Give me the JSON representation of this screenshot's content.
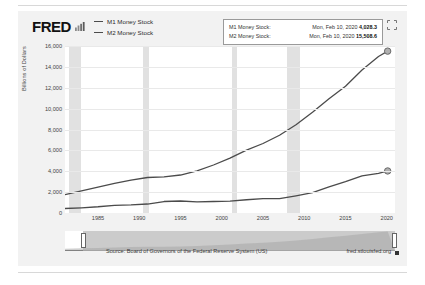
{
  "header": {
    "logo_text": "FRED",
    "logo_mark_icon": "bar-chart-icon",
    "expand_icon": "expand-fullscreen-icon"
  },
  "legend": [
    {
      "label": "M1 Money Stock",
      "color": "#4b4b4b"
    },
    {
      "label": "M2 Money Stock",
      "color": "#4b4b4b"
    }
  ],
  "tooltip": {
    "rows": [
      {
        "name": "M1 Money Stock:",
        "date": "Mon, Feb 10, 2020",
        "value": "4,028.3"
      },
      {
        "name": "M2 Money Stock:",
        "date": "Mon, Feb 10, 2020",
        "value": "15,508.6"
      }
    ]
  },
  "footer": {
    "source": "Source: Board of Governors of the Federal Reserve System (US)",
    "site": "fred.stlouisfed.org"
  },
  "slider": {
    "left_handle_icon": "slider-handle-left",
    "right_handle_icon": "slider-handle-right"
  },
  "chart_data": {
    "type": "line",
    "title": "",
    "xlabel": "",
    "ylabel": "Billions of Dollars",
    "ylim": [
      0,
      16000
    ],
    "yticks": [
      0,
      2000,
      4000,
      6000,
      8000,
      10000,
      12000,
      14000,
      16000
    ],
    "ytick_labels": [
      "0",
      "2,000",
      "4,000",
      "6,000",
      "8,000",
      "10,000",
      "12,000",
      "14,000",
      "16,000"
    ],
    "xlim": [
      1981,
      2021
    ],
    "xticks": [
      1985,
      1990,
      1995,
      2000,
      2005,
      2010,
      2015,
      2020
    ],
    "xtick_labels": [
      "1985",
      "1990",
      "1995",
      "2000",
      "2005",
      "2010",
      "2015",
      "2020"
    ],
    "grid": true,
    "legend_position": "top-left",
    "recession_bands": [
      [
        1981.5,
        1982.9
      ],
      [
        1990.5,
        1991.2
      ],
      [
        2001.2,
        2001.9
      ],
      [
        2007.9,
        2009.5
      ]
    ],
    "series": [
      {
        "name": "M1 Money Stock",
        "color": "#4b4b4b",
        "end_marker": true,
        "x": [
          1981,
          1983,
          1985,
          1987,
          1989,
          1991,
          1993,
          1995,
          1997,
          1999,
          2001,
          2003,
          2005,
          2007,
          2009,
          2011,
          2013,
          2015,
          2017,
          2019,
          2020.11
        ],
        "y": [
          430,
          500,
          600,
          740,
          780,
          860,
          1100,
          1150,
          1070,
          1100,
          1140,
          1270,
          1370,
          1370,
          1650,
          1950,
          2500,
          3000,
          3550,
          3800,
          4028.3
        ]
      },
      {
        "name": "M2 Money Stock",
        "color": "#4b4b4b",
        "end_marker": true,
        "x": [
          1981,
          1983,
          1985,
          1987,
          1989,
          1991,
          1993,
          1995,
          1997,
          1999,
          2001,
          2003,
          2005,
          2007,
          2009,
          2011,
          2013,
          2015,
          2017,
          2019,
          2020.11
        ],
        "y": [
          1750,
          2130,
          2480,
          2830,
          3160,
          3400,
          3470,
          3640,
          4040,
          4600,
          5250,
          6030,
          6660,
          7450,
          8450,
          9650,
          10950,
          12150,
          13700,
          15000,
          15508.6
        ]
      }
    ]
  }
}
